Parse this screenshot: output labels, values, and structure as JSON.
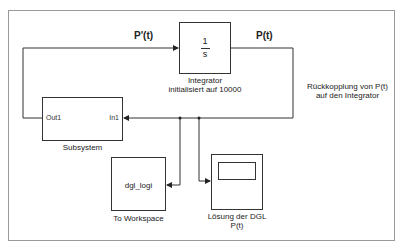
{
  "signals": {
    "derivative": "P'(t)",
    "state": "P(t)"
  },
  "blocks": {
    "integrator": {
      "numerator": "1",
      "denominator": "s",
      "label_line1": "Integrator",
      "label_line2": "initialisiert auf 10000"
    },
    "subsystem": {
      "label": "Subsystem",
      "out_port": "Out1",
      "in_port": "In1"
    },
    "to_workspace": {
      "variable": "dgl_logi",
      "label": "To Workspace"
    },
    "scope": {
      "label_line1": "Lösung der DGL",
      "label_line2": "P(t)"
    }
  },
  "annotation": {
    "line1": "Rückkopplung von P(t)",
    "line2": "auf den Integrator"
  }
}
